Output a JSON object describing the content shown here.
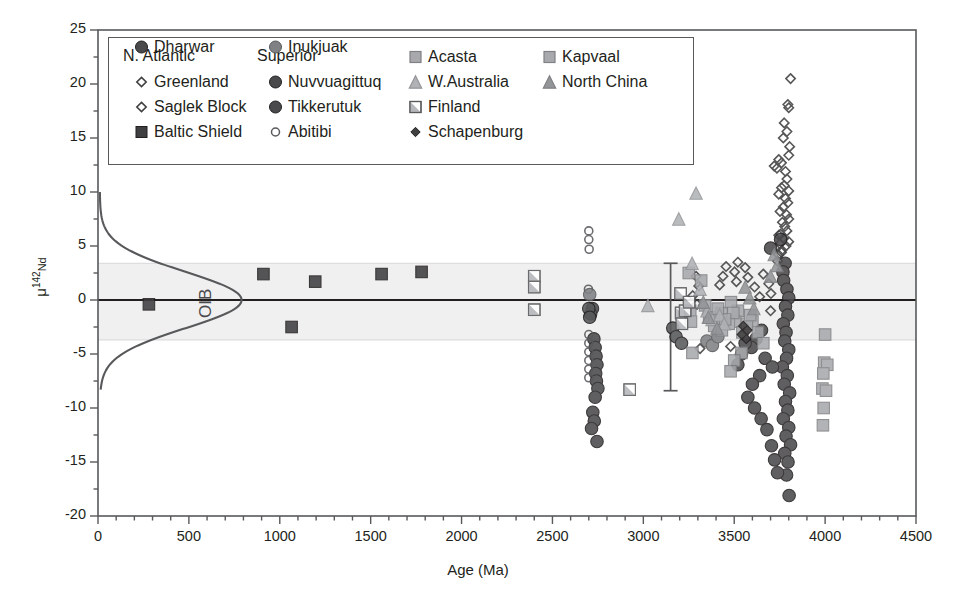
{
  "chart_data": {
    "type": "scatter",
    "title": "",
    "xlabel": "Age (Ma)",
    "ylabel": "μ142Nd",
    "ylabel_base": "μ",
    "ylabel_sup": "142",
    "ylabel_sub": "Nd",
    "xlim": [
      0,
      4500
    ],
    "ylim": [
      -20,
      25
    ],
    "xticks": [
      0,
      500,
      1000,
      1500,
      2000,
      2500,
      3000,
      3500,
      4000,
      4500
    ],
    "yticks": [
      -20,
      -15,
      -10,
      -5,
      0,
      5,
      10,
      15,
      20,
      25
    ],
    "xminor_step": 100,
    "yminor_step": 2.5,
    "grid": false,
    "legend_position": "upper-left-inside",
    "zero_line": 0,
    "shaded_band": {
      "label": "modern mantle band",
      "ymin": -3.7,
      "ymax": 3.4,
      "color": "#f0f0f0"
    },
    "annotation": {
      "text": "OIB",
      "x": 620,
      "y": -0.3,
      "rotation": -90
    },
    "oib_curve": {
      "description": "Gaussian distribution of modern OIB mu142Nd, drawn sideways (density along x, mu142Nd along y)",
      "mean": 0.0,
      "sigma": 2.6,
      "peak_age": 790,
      "base_age": 10,
      "ytop": 10,
      "ybottom": -8.3,
      "color": "#58595b"
    },
    "error_bar": {
      "x": 3150,
      "ymin": -8.4,
      "ymax": 3.4,
      "color": "#58595b"
    },
    "series": [
      {
        "name": "Greenland",
        "marker": "diamond-open",
        "fill": "none",
        "stroke": "#404041",
        "points": [
          [
            3810,
            20.5
          ],
          [
            3795,
            18.1
          ],
          [
            3800,
            17.8
          ],
          [
            3775,
            16.4
          ],
          [
            3790,
            15.6
          ],
          [
            3770,
            15.0
          ],
          [
            3805,
            14.2
          ],
          [
            3800,
            13.4
          ],
          [
            3745,
            13.0
          ],
          [
            3760,
            12.7
          ],
          [
            3735,
            12.2
          ],
          [
            3720,
            12.4
          ],
          [
            3782,
            11.9
          ],
          [
            3790,
            11.2
          ],
          [
            3775,
            10.6
          ],
          [
            3800,
            10.1
          ],
          [
            3760,
            10.4
          ],
          [
            3745,
            9.8
          ],
          [
            3782,
            9.4
          ],
          [
            3795,
            9.0
          ],
          [
            3770,
            8.6
          ],
          [
            3752,
            8.2
          ],
          [
            3788,
            7.9
          ],
          [
            3800,
            7.5
          ],
          [
            3765,
            7.2
          ],
          [
            3778,
            6.8
          ],
          [
            3790,
            6.4
          ],
          [
            3755,
            6.1
          ],
          [
            3772,
            5.7
          ],
          [
            3800,
            5.4
          ],
          [
            3785,
            5.0
          ],
          [
            3762,
            4.6
          ],
          [
            3744,
            4.2
          ],
          [
            3520,
            3.5
          ],
          [
            3502,
            2.6
          ],
          [
            3512,
            1.7
          ],
          [
            3290,
            2.2
          ],
          [
            3305,
            1.3
          ],
          [
            3272,
            0.4
          ],
          [
            3295,
            -0.4
          ],
          [
            3330,
            -0.5
          ],
          [
            3352,
            -1.3
          ],
          [
            3560,
            3.0
          ],
          [
            3575,
            2.1
          ],
          [
            3612,
            1.2
          ],
          [
            3640,
            0.3
          ],
          [
            3660,
            2.4
          ],
          [
            3690,
            1.5
          ],
          [
            3702,
            0.6
          ],
          [
            3312,
            -4.5
          ],
          [
            3700,
            -1.0
          ],
          [
            3480,
            -4.3
          ],
          [
            3455,
            3.1
          ],
          [
            3438,
            2.2
          ],
          [
            3420,
            1.4
          ]
        ]
      },
      {
        "name": "Saglek Block",
        "marker": "diamond-open",
        "fill": "none",
        "stroke": "#404041",
        "points": [
          [
            3745,
            6.0
          ],
          [
            3752,
            5.2
          ],
          [
            3760,
            4.4
          ],
          [
            3738,
            3.6
          ]
        ]
      },
      {
        "name": "Baltic Shield",
        "marker": "square-filled",
        "fill": "#3f3f41",
        "stroke": "#231f20",
        "points": [
          [
            280,
            -0.4
          ],
          [
            910,
            2.4
          ],
          [
            1195,
            1.7
          ],
          [
            1560,
            2.4
          ],
          [
            1780,
            2.6
          ],
          [
            1065,
            -2.5
          ]
        ]
      },
      {
        "name": "Dharwar",
        "marker": "circle-filled",
        "fill": "#4a4a4c",
        "stroke": "#231f20",
        "points": [
          [
            2720,
            -0.8
          ],
          [
            2728,
            -3.6
          ],
          [
            2735,
            -4.4
          ],
          [
            2740,
            -5.2
          ],
          [
            2745,
            -6.0
          ],
          [
            2738,
            -6.8
          ],
          [
            2742,
            -7.5
          ],
          [
            2750,
            -8.2
          ],
          [
            2735,
            -9.0
          ],
          [
            2722,
            -10.4
          ],
          [
            2730,
            -11.2
          ],
          [
            2715,
            -11.9
          ],
          [
            2745,
            -13.1
          ],
          [
            2710,
            -1.3
          ]
        ]
      },
      {
        "name": "Nuvvuagittuq",
        "marker": "circle-filled",
        "fill": "#4a4a4c",
        "stroke": "#231f20",
        "points": [
          [
            3755,
            5.6
          ],
          [
            3780,
            3.4
          ],
          [
            3768,
            2.6
          ],
          [
            3772,
            1.8
          ],
          [
            3790,
            1.0
          ],
          [
            3800,
            0.2
          ],
          [
            3782,
            -0.6
          ],
          [
            3795,
            -1.4
          ],
          [
            3770,
            -2.2
          ],
          [
            3785,
            -3.0
          ],
          [
            3778,
            -3.8
          ],
          [
            3800,
            -4.6
          ],
          [
            3788,
            -5.4
          ],
          [
            3765,
            -6.2
          ],
          [
            3792,
            -7.0
          ],
          [
            3775,
            -7.8
          ],
          [
            3805,
            -8.6
          ],
          [
            3782,
            -9.4
          ],
          [
            3795,
            -10.2
          ],
          [
            3770,
            -11.0
          ],
          [
            3800,
            -11.8
          ],
          [
            3785,
            -12.6
          ],
          [
            3810,
            -13.4
          ],
          [
            3778,
            -14.2
          ],
          [
            3796,
            -15.0
          ],
          [
            3788,
            -16.2
          ],
          [
            3802,
            -18.1
          ],
          [
            3700,
            4.8
          ],
          [
            3650,
            -2.8
          ],
          [
            3620,
            -3.6
          ],
          [
            3595,
            -4.4
          ],
          [
            3670,
            -5.4
          ],
          [
            3710,
            -6.2
          ],
          [
            3640,
            -7.0
          ],
          [
            3600,
            -7.8
          ],
          [
            3560,
            -4.0
          ],
          [
            3540,
            -5.0
          ],
          [
            3520,
            -6.0
          ],
          [
            3575,
            -9.0
          ],
          [
            3612,
            -10.0
          ],
          [
            3648,
            -11.0
          ],
          [
            3680,
            -12.0
          ],
          [
            3705,
            -13.5
          ],
          [
            3722,
            -14.8
          ],
          [
            3738,
            -16.0
          ]
        ]
      },
      {
        "name": "Tikkerutuk",
        "marker": "circle-filled",
        "fill": "#58595b",
        "stroke": "#231f20",
        "points": [
          [
            3162,
            -2.6
          ],
          [
            3180,
            -3.4
          ],
          [
            3210,
            -4.0
          ],
          [
            2700,
            -0.8
          ],
          [
            2705,
            -1.6
          ]
        ]
      },
      {
        "name": "Abitibi",
        "marker": "circle-open",
        "fill": "none",
        "stroke": "#58595b",
        "points": [
          [
            2700,
            6.4
          ],
          [
            2700,
            5.6
          ],
          [
            2702,
            4.7
          ],
          [
            2698,
            1.0
          ],
          [
            2700,
            -3.2
          ],
          [
            2700,
            -4.0
          ],
          [
            2700,
            -4.8
          ],
          [
            2700,
            -5.6
          ],
          [
            2700,
            -6.4
          ],
          [
            2700,
            -7.2
          ]
        ]
      },
      {
        "name": "Inukjuak",
        "marker": "circle-filled",
        "fill": "#808184",
        "stroke": "#58595b",
        "points": [
          [
            2705,
            0.5
          ],
          [
            3350,
            -3.8
          ],
          [
            3380,
            -4.2
          ],
          [
            3410,
            -3.4
          ]
        ]
      },
      {
        "name": "Acasta",
        "marker": "square-filled",
        "fill": "#a7a9ac",
        "stroke": "#808184",
        "points": [
          [
            4000,
            -3.2
          ],
          [
            3995,
            -5.8
          ],
          [
            4012,
            -6.0
          ],
          [
            3990,
            -6.8
          ],
          [
            3985,
            -8.2
          ],
          [
            4005,
            -8.4
          ],
          [
            3992,
            -10.0
          ],
          [
            3988,
            -11.6
          ],
          [
            3520,
            -1.0
          ],
          [
            3505,
            -2.0
          ],
          [
            3540,
            -4.9
          ],
          [
            3250,
            2.5
          ],
          [
            3258,
            -1.0
          ],
          [
            3262,
            -2.0
          ],
          [
            3270,
            -4.9
          ],
          [
            3318,
            1.8
          ],
          [
            3340,
            -0.5
          ],
          [
            3362,
            -1.6
          ],
          [
            3390,
            -2.4
          ],
          [
            3430,
            -1.2
          ],
          [
            3470,
            -2.2
          ],
          [
            3500,
            -5.6
          ],
          [
            3480,
            -6.6
          ],
          [
            3600,
            -2.0
          ],
          [
            3630,
            -3.0
          ],
          [
            3660,
            -4.0
          ]
        ]
      },
      {
        "name": "Kapvaal",
        "marker": "square-filled",
        "fill": "#a7a9ac",
        "stroke": "#808184",
        "points": [
          [
            3482,
            -0.2
          ],
          [
            3495,
            -1.2
          ],
          [
            3450,
            -1.8
          ],
          [
            3432,
            -2.8
          ],
          [
            3410,
            -0.8
          ],
          [
            3545,
            -3.0
          ],
          [
            3570,
            -2.2
          ],
          [
            3588,
            -1.4
          ]
        ]
      },
      {
        "name": "W.Australia",
        "marker": "triangle-filled",
        "fill": "#b0b2b5",
        "stroke": "#939598",
        "points": [
          [
            3290,
            9.9
          ],
          [
            3195,
            7.5
          ],
          [
            3268,
            3.4
          ],
          [
            3312,
            1.0
          ],
          [
            3350,
            -1.0
          ],
          [
            3378,
            -1.8
          ],
          [
            3025,
            -0.5
          ],
          [
            3420,
            -1.4
          ],
          [
            3445,
            -2.2
          ]
        ]
      },
      {
        "name": "North China",
        "marker": "triangle-filled",
        "fill": "#939598",
        "stroke": "#808184",
        "points": [
          [
            3330,
            -0.2
          ],
          [
            3358,
            -1.6
          ],
          [
            3405,
            -2.6
          ],
          [
            3560,
            1.2
          ],
          [
            3585,
            0.2
          ],
          [
            3608,
            -0.8
          ],
          [
            3720,
            4.2
          ],
          [
            3735,
            3.2
          ],
          [
            3700,
            2.2
          ]
        ]
      },
      {
        "name": "Finland",
        "marker": "square-half",
        "fill": "#b5b7ba",
        "stroke": "#58595b",
        "points": [
          [
            2400,
            2.2
          ],
          [
            2400,
            1.2
          ],
          [
            2400,
            -0.9
          ],
          [
            2925,
            -8.3
          ],
          [
            3205,
            0.6
          ],
          [
            3208,
            -1.2
          ],
          [
            3212,
            -2.2
          ],
          [
            3230,
            -1.0
          ],
          [
            3252,
            -0.2
          ]
        ]
      },
      {
        "name": "Schapenburg",
        "marker": "diamond-filled",
        "fill": "#404041",
        "stroke": "#231f20",
        "points": [
          [
            3550,
            -2.4
          ],
          [
            3558,
            -3.0
          ],
          [
            3566,
            -3.6
          ],
          [
            3542,
            -3.2
          ],
          [
            3572,
            -2.8
          ]
        ]
      }
    ]
  },
  "legend": {
    "columns": [
      {
        "header": "N. Atlantic",
        "items": [
          {
            "label": "Greenland",
            "marker": "diamond-open"
          },
          {
            "label": "Saglek Block",
            "marker": "diamond-open"
          },
          {
            "label": "Baltic Shield",
            "marker": "square-filled-dark"
          },
          {
            "label": "Dharwar",
            "marker": "circle-filled-dark"
          }
        ]
      },
      {
        "header": "Superior",
        "items": [
          {
            "label": "Nuvvuagittuq",
            "marker": "circle-filled-dark"
          },
          {
            "label": "Tikkerutuk",
            "marker": "circle-filled-dark"
          },
          {
            "label": "Abitibi",
            "marker": "circle-open"
          },
          {
            "label": "Inukjuak",
            "marker": "circle-filled-gray"
          }
        ]
      },
      {
        "header": "",
        "items": [
          {
            "label": "Acasta",
            "marker": "square-filled-gray"
          },
          {
            "label": "W.Australia",
            "marker": "triangle-filled-light"
          },
          {
            "label": "Finland",
            "marker": "square-half"
          },
          {
            "label": "Schapenburg",
            "marker": "diamond-filled-dark"
          }
        ]
      },
      {
        "header": "",
        "items": [
          {
            "label": "Kapvaal",
            "marker": "square-filled-gray"
          },
          {
            "label": "North China",
            "marker": "triangle-filled-gray"
          }
        ]
      }
    ]
  },
  "colors": {
    "axis": "#231f20",
    "frame": "#58595b",
    "band": "#f0f0f0",
    "band_edge": "#d9d9d9",
    "zero_line": "#231f20",
    "curve": "#58595b",
    "dark_marker": "#3f3f41",
    "mid_marker": "#808184",
    "light_marker": "#a7a9ac"
  },
  "caption": {
    "partial_text": ""
  }
}
